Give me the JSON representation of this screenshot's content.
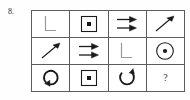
{
  "puzzle": {
    "number_label": "8.",
    "type": "matrix-reasoning-grid",
    "rows": 3,
    "columns": 4,
    "stroke_color": "#1a1a1a",
    "grid_line_color": "#5c5c5c",
    "background_color": "#ffffff",
    "cells": [
      {
        "row": 1,
        "col": 1,
        "symbol_name": "corner-l-icon",
        "symbol_char": "L",
        "description": "L shape, light gray stroke"
      },
      {
        "row": 1,
        "col": 2,
        "symbol_name": "square-with-dot-icon",
        "symbol_char": "⊡",
        "description": "square outline with filled center dot"
      },
      {
        "row": 1,
        "col": 3,
        "symbol_name": "double-right-arrow-icon",
        "symbol_char": "⇉",
        "description": "two stacked arrows pointing right"
      },
      {
        "row": 1,
        "col": 4,
        "symbol_name": "diagonal-up-right-arrow-icon",
        "symbol_char": "↗",
        "description": "thin arrow pointing up-right"
      },
      {
        "row": 2,
        "col": 1,
        "symbol_name": "diagonal-up-right-arrow-icon",
        "symbol_char": "↗",
        "description": "thin arrow pointing up-right"
      },
      {
        "row": 2,
        "col": 2,
        "symbol_name": "double-right-arrow-icon",
        "symbol_char": "⇉",
        "description": "two stacked arrows pointing right"
      },
      {
        "row": 2,
        "col": 3,
        "symbol_name": "corner-l-icon",
        "symbol_char": "L",
        "description": "L shape, light gray stroke"
      },
      {
        "row": 2,
        "col": 4,
        "symbol_name": "circle-with-dot-icon",
        "symbol_char": "⊙",
        "description": "circle outline with filled center dot"
      },
      {
        "row": 3,
        "col": 1,
        "symbol_name": "circular-arrow-left-gap-icon",
        "symbol_char": "↺",
        "description": "circular arrow with gap at left, arrowhead at lower-left"
      },
      {
        "row": 3,
        "col": 2,
        "symbol_name": "square-with-dot-icon",
        "symbol_char": "⊡",
        "description": "square outline with filled center dot"
      },
      {
        "row": 3,
        "col": 3,
        "symbol_name": "circular-arrow-top-gap-icon",
        "symbol_char": "↻",
        "description": "circular arrow with gap at top, arrowhead pointing up at right"
      },
      {
        "row": 3,
        "col": 4,
        "symbol_name": "question-mark",
        "symbol_char": "?",
        "description": "missing answer cell"
      }
    ],
    "answer_cell_text": "?"
  }
}
